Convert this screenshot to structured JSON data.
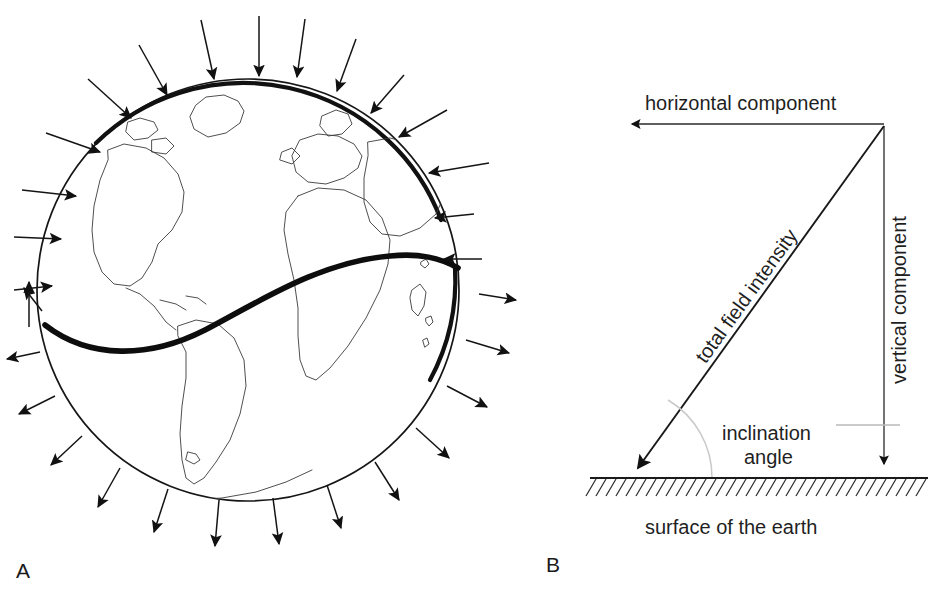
{
  "figure": {
    "background_color": "#ffffff",
    "ink_color": "#141414"
  },
  "panel_a": {
    "label": "A",
    "description": "Globe with magnetic field direction arrows and magnetic equator",
    "globe": {
      "center_x": 248,
      "center_y": 290,
      "radius": 212
    },
    "magnetic_equator": {
      "style": "thick S-curve",
      "color": "#0d0d0d"
    },
    "arrows": {
      "northern_hemisphere_direction": "inward",
      "southern_hemisphere_direction": "outward",
      "count": 28
    }
  },
  "panel_b": {
    "label": "B",
    "labels": {
      "horizontal_component": "horizontal component",
      "vertical_component": "vertical component",
      "total_field_intensity": "total field intensity",
      "inclination_angle_line1": "inclination",
      "inclination_angle_line2": "angle",
      "surface_of_the_earth": "surface of the earth"
    },
    "geometry": {
      "apex_x": 884,
      "apex_y": 126,
      "ground_y": 478,
      "vector_tip_x": 626,
      "horizontal_tip_x": 625
    }
  }
}
